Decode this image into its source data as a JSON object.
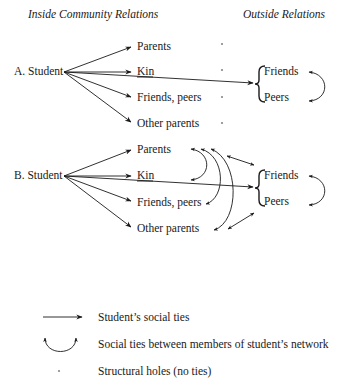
{
  "headers": {
    "inside": "Inside Community Relations",
    "outside": "Outside Relations"
  },
  "panel_a": {
    "label": "A. Student",
    "inside_nodes": [
      "Parents",
      "Kin",
      "Friends, peers",
      "Other parents"
    ],
    "outside_nodes": [
      "Friends",
      "Peers"
    ],
    "structural_holes": [
      "*",
      "*",
      "*",
      "*"
    ]
  },
  "panel_b": {
    "label": "B. Student",
    "inside_nodes": [
      "Parents",
      "Kin",
      "Friends, peers",
      "Other parents"
    ],
    "outside_nodes": [
      "Friends",
      "Peers"
    ]
  },
  "legend": {
    "items": [
      {
        "symbol": "arrow",
        "label": "Student’s social ties"
      },
      {
        "symbol": "curved-double-arrow",
        "label": "Social ties between members of student’s network"
      },
      {
        "symbol": "asterisk",
        "label": "Structural holes (no ties)"
      }
    ]
  },
  "colors": {
    "ink": "#1a1a1a",
    "background": "#ffffff"
  }
}
